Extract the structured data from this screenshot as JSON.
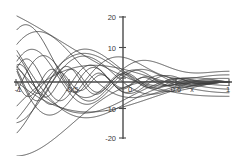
{
  "figure": {
    "title": "",
    "background_color": "#ffffff",
    "curve_color": "#3c3c3c",
    "axis_color": "#4a4a4a"
  },
  "chart_data": {
    "type": "line",
    "title": "",
    "subtitle": "",
    "xlabel": "x",
    "ylabel": "",
    "xlim": [
      -1,
      1
    ],
    "ylim": [
      -20,
      20
    ],
    "grid": false,
    "legend": false,
    "legend_position": "none",
    "axis_style": "centered-cross",
    "x_ticks": [
      -1,
      -0.5,
      0,
      0.5,
      1
    ],
    "x_tick_labels": [
      "-1",
      "-0.5",
      "0",
      "0.5",
      "1"
    ],
    "y_ticks": [
      -20,
      -10,
      0,
      10,
      20
    ],
    "y_tick_labels": [
      "-20",
      "-10",
      "0",
      "10",
      "20"
    ],
    "annotations": [
      {
        "text": "x",
        "x": 0.78,
        "y": -2.2
      }
    ],
    "series": [
      {
        "name": "n=1",
        "degree": 1,
        "amplitude": 17.0,
        "frequency": 1.0
      },
      {
        "name": "n=2",
        "degree": 2,
        "amplitude": 15.5,
        "frequency": 1.6
      },
      {
        "name": "n=3",
        "degree": 3,
        "amplitude": 14.0,
        "frequency": 2.3
      },
      {
        "name": "n=4",
        "degree": 4,
        "amplitude": 12.5,
        "frequency": 3.0
      },
      {
        "name": "n=5",
        "degree": 5,
        "amplitude": 11.0,
        "frequency": 3.8
      },
      {
        "name": "n=6",
        "degree": 6,
        "amplitude": 9.5,
        "frequency": 4.6
      },
      {
        "name": "n=7",
        "degree": 7,
        "amplitude": 8.5,
        "frequency": 5.4
      },
      {
        "name": "n=8",
        "degree": 8,
        "amplitude": 7.5,
        "frequency": 6.3
      },
      {
        "name": "n=9",
        "degree": 9,
        "amplitude": 6.5,
        "frequency": 7.2
      },
      {
        "name": "n=10",
        "degree": 10,
        "amplitude": 5.5,
        "frequency": 8.1
      },
      {
        "name": "n=11",
        "degree": 11,
        "amplitude": 4.8,
        "frequency": 9.0
      },
      {
        "name": "n=12",
        "degree": 12,
        "amplitude": 4.0,
        "frequency": 10.0
      }
    ],
    "baseline_series": {
      "name": "axis-overlay",
      "values_y": 0
    }
  },
  "axes": {
    "x_axis_label": "x",
    "y_axis_label": "",
    "x_min_label": "-1",
    "x_mid_neg_label": "-0.5",
    "x_zero_label": "0",
    "x_mid_pos_label": "0.5",
    "x_max_label": "1",
    "y_top_label": "20",
    "y_upper_label": "10",
    "y_zero_label": "0",
    "y_lower_label": "-10",
    "y_bottom_label": "-20"
  }
}
